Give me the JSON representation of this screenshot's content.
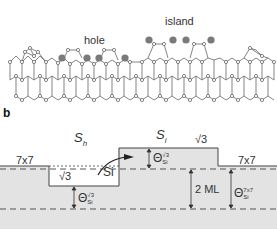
{
  "panel_a": {
    "labels": {
      "hole": "hole",
      "island": "island"
    }
  },
  "panel_b": {
    "panel_label": "b",
    "labels": {
      "s_h": "S",
      "s_h_sub": "h",
      "s_i": "S",
      "s_i_sub": "i",
      "left_7x7": "7x7",
      "right_7x7": "7x7",
      "hole_sqrt3": "√3",
      "island_sqrt3": "√3",
      "si_arrow": "Si",
      "two_ml": "2 ML",
      "theta": "Θ",
      "theta_sub": "Si",
      "theta_sup_sqrt3": "√3",
      "theta_sup_7x7": "7x7"
    }
  },
  "colors": {
    "atom_fill": "#ffffff",
    "atom_stroke": "#555555",
    "adatom": "#7a7a7a",
    "bond": "#666666",
    "substrate": "#e3e3e3",
    "line": "#444444"
  }
}
